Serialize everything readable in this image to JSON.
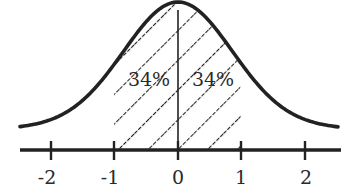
{
  "chart_data": {
    "type": "area",
    "title": "",
    "xlabel": "",
    "ylabel": "",
    "x_ticks": [
      "-2",
      "-1",
      "0",
      "1",
      "2"
    ],
    "xlim": [
      -2.5,
      2.5
    ],
    "grid": false,
    "legend": null,
    "shaded_region": {
      "from": -1,
      "to": 1,
      "pattern": "diagonal-hatch"
    },
    "divider_at": 0,
    "annotations": [
      {
        "text": "34%",
        "region": [
          -1,
          0
        ]
      },
      {
        "text": "34%",
        "region": [
          0,
          1
        ]
      }
    ]
  },
  "labels": {
    "left_pct": "34%",
    "right_pct": "34%",
    "ticks": [
      "-2",
      "-1",
      "0",
      "1",
      "2"
    ]
  },
  "colors": {
    "ink": "#222222",
    "background": "#ffffff"
  }
}
